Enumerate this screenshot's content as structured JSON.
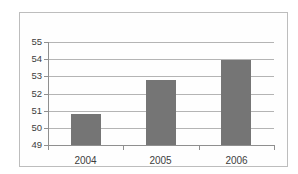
{
  "chart_data": {
    "type": "bar",
    "title": "",
    "xlabel": "",
    "ylabel": "",
    "categories": [
      "2004",
      "2005",
      "2006"
    ],
    "values": [
      50.8,
      52.8,
      53.95
    ],
    "ylim": [
      49,
      55
    ],
    "yticks": [
      55,
      54,
      53,
      52,
      51,
      50,
      49
    ],
    "grid": true,
    "legend_position": "none",
    "bar_color": "#757575",
    "gridline_color": "#b4b4b4",
    "axis_color": "#8f8f8f",
    "text_color": "#3d3d3d",
    "frame_border_color": "#bdbdbd",
    "background_color": "#fefefe"
  }
}
